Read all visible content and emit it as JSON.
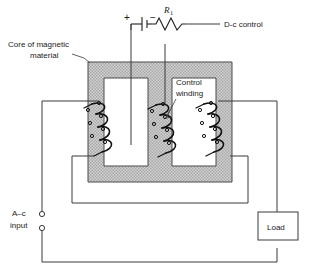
{
  "figure": {
    "type": "schematic-diagram",
    "background_color": "#ffffff",
    "core_fill_color": "#c9c9c9",
    "wire_color": "#3a3a3a",
    "coil_color": "#101010"
  },
  "labels": {
    "core": "Core of magnetic\nmaterial",
    "core_line1": "Core of magnetic",
    "core_line2": "material",
    "control_winding_line1": "Control",
    "control_winding_line2": "winding",
    "dc_control": "D-c control",
    "ac_input_line1": "A–c",
    "ac_input_line2": "input",
    "load": "Load",
    "resistor": "R",
    "resistor_subscript": "1",
    "battery_positive": "+",
    "battery_negative": "−"
  },
  "components": [
    {
      "name": "battery",
      "label": "+ / −",
      "location": "top-center"
    },
    {
      "name": "resistor",
      "label": "R1",
      "location": "top-center-right"
    },
    {
      "name": "core",
      "label": "Core of magnetic material",
      "location": "center"
    },
    {
      "name": "control-winding",
      "label": "Control winding",
      "location": "center-leg"
    },
    {
      "name": "ac-coil-left",
      "label": "A-c winding left",
      "location": "left-leg"
    },
    {
      "name": "ac-coil-right",
      "label": "A-c winding right",
      "location": "right-leg"
    },
    {
      "name": "load",
      "label": "Load",
      "location": "right"
    },
    {
      "name": "ac-input-terminals",
      "label": "A-c input",
      "location": "left"
    }
  ],
  "terminals": {
    "ac_input_top": "o",
    "ac_input_bottom": "o"
  }
}
